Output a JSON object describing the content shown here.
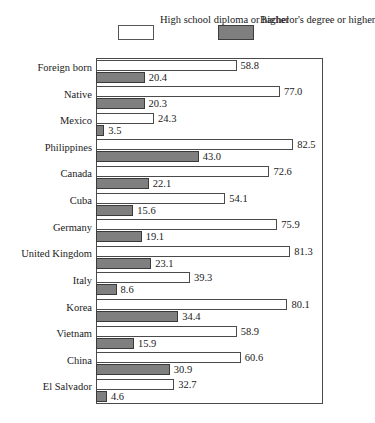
{
  "chart_data": {
    "type": "bar",
    "orientation": "horizontal",
    "title": "",
    "xlabel": "",
    "ylabel": "",
    "xlim": [
      0,
      95
    ],
    "grid": false,
    "legend_position": "top",
    "categories": [
      "Foreign born",
      "Native",
      "Mexico",
      "Philippines",
      "Canada",
      "Cuba",
      "Germany",
      "United Kingdom",
      "Italy",
      "Korea",
      "Vietnam",
      "China",
      "El Salvador"
    ],
    "series": [
      {
        "name": "High school diploma or higher",
        "color": "#ffffff",
        "values": [
          58.8,
          77.0,
          24.3,
          82.5,
          72.6,
          54.1,
          75.9,
          81.3,
          39.3,
          80.1,
          58.9,
          60.6,
          32.7
        ],
        "labels": [
          "58.8",
          "77.0",
          "24.3",
          "82.5",
          "72.6",
          "54.1",
          "75.9",
          "81.3",
          "39.3",
          "80.1",
          "58.9",
          "60.6",
          "32.7"
        ]
      },
      {
        "name": "Bachelor's degree or higher",
        "color": "#7f7f7f",
        "values": [
          20.4,
          20.3,
          3.5,
          43.0,
          22.1,
          15.6,
          19.1,
          23.1,
          8.6,
          34.4,
          15.9,
          30.9,
          4.6
        ],
        "labels": [
          "20.4",
          "20.3",
          "3.5",
          "43.0",
          "22.1",
          "15.6",
          "19.1",
          "23.1",
          "8.6",
          "34.4",
          "15.9",
          "30.9",
          "4.6"
        ]
      }
    ]
  },
  "legend": {
    "entries": [
      {
        "label": "High school\ndiploma\nor higher",
        "swatch": "white"
      },
      {
        "label": "Bachelor's\ndegree\nor higher",
        "swatch": "gray"
      }
    ]
  }
}
